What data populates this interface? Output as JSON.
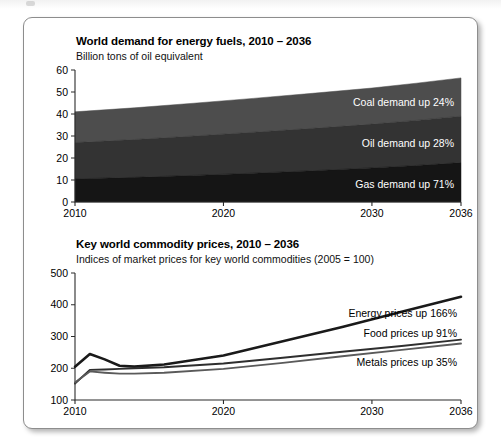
{
  "figure": {
    "card_label": "energy-outlook-figure"
  },
  "chart_data": [
    {
      "id": "world-energy-demand",
      "type": "area",
      "title": "World demand for energy fuels, 2010 – 2036",
      "subtitle": "Billion tons of oil equivalent",
      "ylabel": "",
      "xlabel": "",
      "ylim": [
        0,
        60
      ],
      "yticks": [
        0,
        10,
        20,
        30,
        40,
        50,
        60
      ],
      "xlim": [
        2010,
        2036
      ],
      "xticks": [
        2010,
        2020,
        2030,
        2036
      ],
      "grid": false,
      "stacked": true,
      "legend_position": "inline-right",
      "x": [
        2010,
        2014,
        2018,
        2022,
        2026,
        2030,
        2033,
        2036
      ],
      "series": [
        {
          "name": "Gas",
          "label": "Gas demand up 71%",
          "color": "#151515",
          "values": [
            10.5,
            11.2,
            12.1,
            13.1,
            14.2,
            15.5,
            16.6,
            17.9
          ]
        },
        {
          "name": "Oil",
          "label": "Oil demand up 28%",
          "color": "#333333",
          "values": [
            16.5,
            17.2,
            17.9,
            18.6,
            19.3,
            19.9,
            20.5,
            21.1
          ]
        },
        {
          "name": "Coal",
          "label": "Coal demand up 24%",
          "color": "#4d4d4d",
          "values": [
            14.0,
            14.4,
            14.9,
            15.4,
            15.9,
            16.4,
            16.9,
            17.4
          ]
        }
      ],
      "stack_totals_note": "2010 total ≈ 41, 2036 total ≈ 56"
    },
    {
      "id": "key-world-commodity-prices",
      "type": "line",
      "title": "Key world commodity prices, 2010 – 2036",
      "subtitle": "Indices of market prices for key world commodities (2005 = 100)",
      "ylabel": "",
      "xlabel": "",
      "ylim": [
        100,
        500
      ],
      "yticks": [
        100,
        200,
        300,
        400,
        500
      ],
      "xlim": [
        2010,
        2036
      ],
      "xticks": [
        2010,
        2020,
        2030,
        2036
      ],
      "grid": false,
      "legend_position": "inline-right",
      "x": [
        2010,
        2011,
        2012,
        2013,
        2014,
        2016,
        2020,
        2024,
        2028,
        2032,
        2036
      ],
      "series": [
        {
          "name": "Energy",
          "label": "Energy prices up 166%",
          "color": "#1a1a1a",
          "width": 2.6,
          "values": [
            205,
            245,
            228,
            208,
            205,
            212,
            240,
            285,
            330,
            378,
            425
          ]
        },
        {
          "name": "Food",
          "label": "Food prices up 91%",
          "color": "#2e2e2e",
          "width": 1.9,
          "values": [
            152,
            195,
            196,
            198,
            200,
            203,
            215,
            233,
            252,
            270,
            290
          ]
        },
        {
          "name": "Metals",
          "label": "Metals prices up 35%",
          "color": "#5a5a5a",
          "width": 1.9,
          "values": [
            155,
            190,
            186,
            183,
            183,
            186,
            198,
            217,
            238,
            258,
            278
          ]
        }
      ]
    }
  ]
}
